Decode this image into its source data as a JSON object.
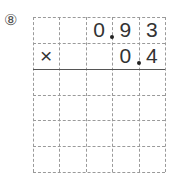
{
  "problem": {
    "number_label": "⑧",
    "operator": "×",
    "columns": 5,
    "rows": 6,
    "rows_content": [
      [
        "",
        "",
        "0",
        "9",
        "3"
      ],
      [
        "×",
        "",
        "",
        "0",
        "4"
      ]
    ],
    "multiplicand": "0.93",
    "multiplier": "0.4",
    "decimal_points": [
      {
        "row": 0,
        "after_column": 2
      },
      {
        "row": 1,
        "after_column": 3
      }
    ],
    "answer_line_after_row": 2
  }
}
